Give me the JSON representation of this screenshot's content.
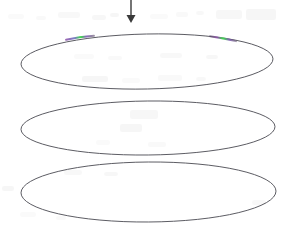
{
  "figure": {
    "background_color": "#ffffff",
    "width": 288,
    "height": 229,
    "stroke_color": "#4a4a52",
    "stroke_width": 0.9,
    "arrow": {
      "name": "downward arrow",
      "color": "#3a3a3a",
      "shaft_x": 131,
      "shaft_top_y": 0,
      "shaft_bottom_y": 15,
      "head_tip_y": 23,
      "head_half_width": 4.5,
      "shaft_width": 1.4
    },
    "ellipses": [
      {
        "id": "ellipse-top",
        "label": "Top ellipse",
        "cx": 147,
        "cy": 61.5,
        "rx": 126,
        "ry": 27.5,
        "rotation": -1.2
      },
      {
        "id": "ellipse-middle",
        "label": "Middle ellipse",
        "cx": 148,
        "cy": 128,
        "rx": 127,
        "ry": 27,
        "rotation": -0.6
      },
      {
        "id": "ellipse-bottom",
        "label": "Bottom ellipse",
        "cx": 148.5,
        "cy": 192,
        "rx": 127.5,
        "ry": 30,
        "rotation": -0.4
      }
    ],
    "highlights": [
      {
        "id": "highlight-left",
        "label": "Left green-violet arc segment",
        "on_ellipse": "ellipse-top",
        "x": 68,
        "y": 36,
        "width": 24,
        "height": 4,
        "core_color": "#3ddc4a",
        "edge_color": "#8a4fa8"
      },
      {
        "id": "highlight-right",
        "label": "Right green-violet arc segment",
        "on_ellipse": "ellipse-top",
        "x": 212,
        "y": 37,
        "width": 22,
        "height": 4,
        "core_color": "#3ddc4a",
        "edge_color": "#8a4fa8"
      }
    ],
    "scan_artifacts": [
      {
        "x": 8,
        "y": 14,
        "w": 16,
        "h": 5
      },
      {
        "x": 36,
        "y": 16,
        "w": 10,
        "h": 4
      },
      {
        "x": 58,
        "y": 12,
        "w": 22,
        "h": 6
      },
      {
        "x": 92,
        "y": 15,
        "w": 14,
        "h": 5
      },
      {
        "x": 110,
        "y": 13,
        "w": 9,
        "h": 4
      },
      {
        "x": 150,
        "y": 14,
        "w": 18,
        "h": 5
      },
      {
        "x": 176,
        "y": 12,
        "w": 12,
        "h": 5
      },
      {
        "x": 196,
        "y": 11,
        "w": 8,
        "h": 4
      },
      {
        "x": 216,
        "y": 10,
        "w": 26,
        "h": 9
      },
      {
        "x": 246,
        "y": 9,
        "w": 30,
        "h": 11
      },
      {
        "x": 74,
        "y": 54,
        "w": 20,
        "h": 5
      },
      {
        "x": 108,
        "y": 56,
        "w": 14,
        "h": 4
      },
      {
        "x": 160,
        "y": 53,
        "w": 22,
        "h": 5
      },
      {
        "x": 206,
        "y": 55,
        "w": 12,
        "h": 4
      },
      {
        "x": 82,
        "y": 76,
        "w": 26,
        "h": 6
      },
      {
        "x": 122,
        "y": 78,
        "w": 18,
        "h": 5
      },
      {
        "x": 158,
        "y": 75,
        "w": 24,
        "h": 6
      },
      {
        "x": 196,
        "y": 77,
        "w": 10,
        "h": 4
      },
      {
        "x": 130,
        "y": 110,
        "w": 28,
        "h": 9
      },
      {
        "x": 120,
        "y": 124,
        "w": 22,
        "h": 8
      },
      {
        "x": 96,
        "y": 140,
        "w": 14,
        "h": 5
      },
      {
        "x": 148,
        "y": 142,
        "w": 18,
        "h": 5
      },
      {
        "x": 64,
        "y": 170,
        "w": 18,
        "h": 5
      },
      {
        "x": 104,
        "y": 172,
        "w": 14,
        "h": 4
      },
      {
        "x": 2,
        "y": 186,
        "w": 12,
        "h": 5
      },
      {
        "x": 20,
        "y": 212,
        "w": 16,
        "h": 5
      },
      {
        "x": 56,
        "y": 216,
        "w": 10,
        "h": 4
      },
      {
        "x": 252,
        "y": 200,
        "w": 14,
        "h": 5
      }
    ]
  }
}
